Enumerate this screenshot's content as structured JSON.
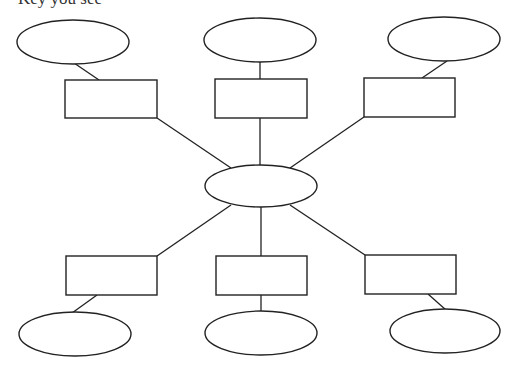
{
  "header": {
    "partial_text": "Key you see"
  },
  "diagram": {
    "type": "spider-web graphic organizer",
    "stroke_color": "#222222",
    "center": {
      "label": "",
      "cx": 261,
      "cy": 186,
      "rx": 56,
      "ry": 21
    },
    "branches": [
      {
        "id": "top-left",
        "box": {
          "x": 65,
          "y": 80,
          "w": 92,
          "h": 38,
          "label": ""
        },
        "bubble": {
          "cx": 73,
          "cy": 42,
          "rx": 56,
          "ry": 22,
          "label": ""
        }
      },
      {
        "id": "top-middle",
        "box": {
          "x": 215,
          "y": 79,
          "w": 92,
          "h": 39,
          "label": ""
        },
        "bubble": {
          "cx": 260,
          "cy": 40,
          "rx": 56,
          "ry": 22,
          "label": ""
        }
      },
      {
        "id": "top-right",
        "box": {
          "x": 364,
          "y": 78,
          "w": 91,
          "h": 39,
          "label": ""
        },
        "bubble": {
          "cx": 444,
          "cy": 39,
          "rx": 56,
          "ry": 22,
          "label": ""
        }
      },
      {
        "id": "bottom-left",
        "box": {
          "x": 66,
          "y": 256,
          "w": 91,
          "h": 39,
          "label": ""
        },
        "bubble": {
          "cx": 75,
          "cy": 334,
          "rx": 56,
          "ry": 22,
          "label": ""
        }
      },
      {
        "id": "bottom-middle",
        "box": {
          "x": 216,
          "y": 256,
          "w": 91,
          "h": 39,
          "label": ""
        },
        "bubble": {
          "cx": 261,
          "cy": 333,
          "rx": 56,
          "ry": 22,
          "label": ""
        }
      },
      {
        "id": "bottom-right",
        "box": {
          "x": 365,
          "y": 255,
          "w": 91,
          "h": 39,
          "label": ""
        },
        "bubble": {
          "cx": 445,
          "cy": 331,
          "rx": 55,
          "ry": 22,
          "label": ""
        }
      }
    ]
  }
}
